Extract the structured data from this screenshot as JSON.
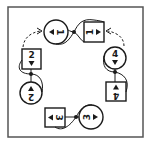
{
  "diagram": {
    "frame": {
      "x": 8,
      "y": 7,
      "w": 135,
      "h": 130
    },
    "colors": {
      "ink": "#1a1a1a",
      "frame": "#555555",
      "background": "#ffffff"
    },
    "nodes": [
      {
        "id": "circle-1",
        "shape": "circle",
        "label": "1",
        "cx": 56,
        "cy": 32,
        "r": 12,
        "arrow": "right",
        "rotation": 90
      },
      {
        "id": "square-1",
        "shape": "square",
        "label": "1",
        "x": 84,
        "y": 22,
        "size": 20,
        "arrow": "left",
        "rotation": -90
      },
      {
        "id": "square-2",
        "shape": "square",
        "label": "2",
        "x": 22,
        "y": 49,
        "size": 20,
        "arrow": "down",
        "rotation": 0
      },
      {
        "id": "circle-2",
        "shape": "circle",
        "label": "2",
        "cx": 31,
        "cy": 93,
        "r": 11,
        "arrow": "up",
        "rotation": 180
      },
      {
        "id": "circle-4",
        "shape": "circle",
        "label": "4",
        "cx": 115,
        "cy": 58,
        "r": 11,
        "arrow": "down",
        "rotation": 0
      },
      {
        "id": "square-4",
        "shape": "square",
        "label": "4",
        "x": 106,
        "y": 82,
        "size": 20,
        "arrow": "up",
        "rotation": 180
      },
      {
        "id": "square-3",
        "shape": "square",
        "label": "3",
        "x": 45,
        "y": 108,
        "size": 20,
        "arrow": "right",
        "rotation": 90
      },
      {
        "id": "circle-3",
        "shape": "circle",
        "label": "3",
        "cx": 91,
        "cy": 117,
        "r": 12,
        "arrow": "left",
        "rotation": -90
      }
    ],
    "junctions": [
      {
        "id": "junction-top",
        "x": 74,
        "y": 32
      },
      {
        "id": "junction-left",
        "x": 31,
        "y": 74
      },
      {
        "id": "junction-right",
        "x": 115,
        "y": 72
      },
      {
        "id": "junction-bottom",
        "x": 76,
        "y": 117
      }
    ],
    "dashed_arrows": [
      {
        "id": "dashed-arrow-left",
        "from": "square-2",
        "to": "circle-1"
      },
      {
        "id": "dashed-arrow-right",
        "from": "circle-4",
        "to": "square-1"
      }
    ]
  }
}
